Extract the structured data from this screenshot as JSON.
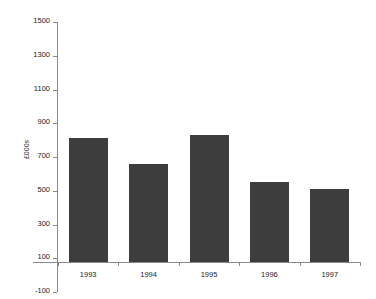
{
  "chart_data": {
    "type": "bar",
    "title": "",
    "xlabel": "",
    "ylabel": "£000s",
    "categories": [
      "1993",
      "1994",
      "1995",
      "1996",
      "1997"
    ],
    "values": [
      810,
      660,
      830,
      550,
      510
    ],
    "series": [
      {
        "name": "£000s",
        "values": [
          810,
          660,
          830,
          550,
          510
        ]
      }
    ],
    "ylim": [
      -100,
      1500
    ],
    "ytick_labels": [
      "1500",
      "1300",
      "1100",
      "900",
      "700",
      "500",
      "300",
      "100",
      "-100"
    ],
    "ytick_values": [
      1500,
      1300,
      1100,
      900,
      700,
      500,
      300,
      100,
      -100
    ],
    "ytick_step": 200,
    "grid": false,
    "legend": "none",
    "bar_color": "#3d3d3d",
    "axis_color": "#8a8a8a",
    "background_color": "#ffffff"
  }
}
